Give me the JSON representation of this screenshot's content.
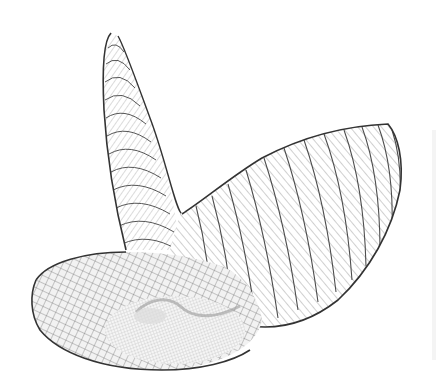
{
  "figure": {
    "colors": {
      "background": "#ffffff",
      "outline": "#3a3a3a",
      "mesh_major": "#5a5a5a",
      "mesh_minor": "#9a9a9a",
      "shading": "#e6e6e6"
    }
  }
}
